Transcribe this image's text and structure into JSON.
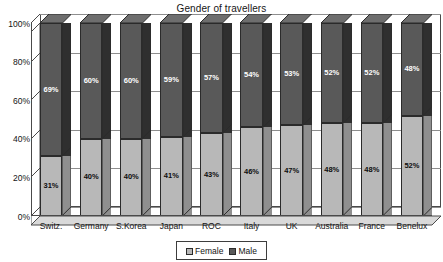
{
  "chart_data": {
    "type": "bar",
    "subtype": "stacked-100-percent-3d",
    "title": "Gender of travellers",
    "xlabel": "",
    "ylabel": "",
    "categories": [
      "Switz.",
      "Germany",
      "S.Korea",
      "Japan",
      "ROC",
      "Italy",
      "UK",
      "Australia",
      "France",
      "Benelux"
    ],
    "series": [
      {
        "name": "Female",
        "color": "#b8b8b8",
        "values": [
          31,
          40,
          40,
          41,
          43,
          46,
          47,
          48,
          48,
          52
        ],
        "labels": [
          "31%",
          "40%",
          "40%",
          "41%",
          "43%",
          "46%",
          "47%",
          "48%",
          "48%",
          "52%"
        ]
      },
      {
        "name": "Male",
        "color": "#595959",
        "values": [
          69,
          60,
          60,
          59,
          57,
          54,
          53,
          52,
          52,
          48
        ],
        "labels": [
          "69%",
          "60%",
          "60%",
          "59%",
          "57%",
          "54%",
          "53%",
          "52%",
          "52%",
          "48%"
        ]
      }
    ],
    "ylim": [
      0,
      100
    ],
    "yticks": [
      0,
      20,
      40,
      60,
      80,
      100
    ],
    "ytick_labels": [
      "0%",
      "20%",
      "40%",
      "60%",
      "80%",
      "100%"
    ],
    "grid": true,
    "legend_position": "bottom-center",
    "legend_entries": [
      "Female",
      "Male"
    ]
  },
  "legend": {
    "female_label": "Female",
    "male_label": "Male"
  }
}
